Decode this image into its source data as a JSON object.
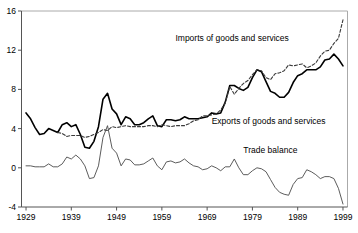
{
  "chart_data": {
    "type": "line",
    "title": "",
    "subtitle": "",
    "xlabel": "",
    "ylabel": "",
    "xlim": [
      1928,
      2000
    ],
    "ylim": [
      -4,
      16
    ],
    "xticks": [
      "1929",
      "1939",
      "1949",
      "1959",
      "1969",
      "1979",
      "1989",
      "1999"
    ],
    "xtick_values": [
      1929,
      1939,
      1949,
      1959,
      1969,
      1979,
      1989,
      1999
    ],
    "yticks": [
      "-4",
      "0",
      "4",
      "8",
      "12",
      "16"
    ],
    "ytick_values": [
      -4,
      0,
      4,
      8,
      12,
      16
    ],
    "grid": false,
    "legend_position": "inline-annotations",
    "x": [
      1929,
      1930,
      1931,
      1932,
      1933,
      1934,
      1935,
      1936,
      1937,
      1938,
      1939,
      1940,
      1941,
      1942,
      1943,
      1944,
      1945,
      1946,
      1947,
      1948,
      1949,
      1950,
      1951,
      1952,
      1953,
      1954,
      1955,
      1956,
      1957,
      1958,
      1959,
      1960,
      1961,
      1962,
      1963,
      1964,
      1965,
      1966,
      1967,
      1968,
      1969,
      1970,
      1971,
      1972,
      1973,
      1974,
      1975,
      1976,
      1977,
      1978,
      1979,
      1980,
      1981,
      1982,
      1983,
      1984,
      1985,
      1986,
      1987,
      1988,
      1989,
      1990,
      1991,
      1992,
      1993,
      1994,
      1995,
      1996,
      1997,
      1998,
      1999
    ],
    "series": [
      {
        "name": "Exports of goods and services",
        "style": "solid-thick",
        "values": [
          5.6,
          5.0,
          4.1,
          3.4,
          3.5,
          4.0,
          3.8,
          3.6,
          4.4,
          4.6,
          4.2,
          4.4,
          3.4,
          2.1,
          2.0,
          2.7,
          4.2,
          7.0,
          7.6,
          6.0,
          5.5,
          4.4,
          5.2,
          5.0,
          4.4,
          4.4,
          4.6,
          5.0,
          5.3,
          4.3,
          4.2,
          4.9,
          4.9,
          4.8,
          4.9,
          5.2,
          5.0,
          5.0,
          5.0,
          5.1,
          5.2,
          5.6,
          5.5,
          5.6,
          6.7,
          8.4,
          8.4,
          8.1,
          7.9,
          8.2,
          9.2,
          10.0,
          9.8,
          8.8,
          7.8,
          7.6,
          7.2,
          7.2,
          7.7,
          8.7,
          9.4,
          9.6,
          10.0,
          10.0,
          10.0,
          10.3,
          11.0,
          11.1,
          11.6,
          11.1,
          10.4
        ]
      },
      {
        "name": "Imports of goods and services",
        "style": "dashed",
        "values": [
          null,
          null,
          null,
          null,
          null,
          null,
          null,
          3.6,
          3.5,
          3.2,
          3.3,
          3.3,
          3.3,
          3.1,
          3.2,
          3.4,
          3.6,
          3.9,
          3.8,
          4.2,
          4.1,
          4.2,
          4.3,
          4.2,
          4.2,
          4.2,
          4.2,
          4.3,
          4.3,
          4.2,
          4.4,
          4.3,
          4.2,
          4.3,
          4.3,
          4.3,
          4.5,
          4.8,
          4.9,
          5.3,
          5.3,
          5.4,
          5.5,
          5.9,
          6.6,
          8.3,
          7.5,
          8.1,
          8.6,
          8.9,
          9.5,
          10.0,
          9.9,
          9.2,
          9.0,
          9.6,
          9.7,
          9.9,
          10.5,
          10.4,
          10.5,
          10.6,
          10.2,
          10.4,
          10.7,
          11.4,
          11.9,
          12.0,
          12.7,
          13.2,
          15.1
        ]
      },
      {
        "name": "Trade balance",
        "style": "solid-thin",
        "values": [
          0.2,
          0.2,
          0.1,
          0.1,
          0.1,
          0.4,
          0.1,
          0.1,
          0.4,
          1.1,
          0.9,
          1.3,
          0.9,
          0.2,
          -1.1,
          -1.0,
          0.2,
          3.1,
          4.3,
          2.0,
          1.5,
          0.2,
          0.9,
          0.8,
          0.3,
          0.3,
          0.4,
          0.7,
          1.0,
          0.2,
          -0.2,
          0.6,
          0.7,
          0.5,
          0.6,
          0.9,
          0.5,
          0.2,
          0.1,
          -0.2,
          -0.1,
          0.2,
          0.0,
          -0.3,
          0.1,
          0.1,
          0.9,
          0.0,
          -0.7,
          -0.7,
          -0.3,
          0.0,
          -0.1,
          -0.4,
          -1.2,
          -2.0,
          -2.5,
          -2.7,
          -2.8,
          -1.7,
          -1.1,
          -1.0,
          -0.2,
          -0.4,
          -0.7,
          -1.1,
          -0.9,
          -0.9,
          -1.1,
          -2.1,
          -3.7
        ]
      }
    ],
    "annotations": [
      {
        "text": "Imports of goods and services",
        "x": 1962,
        "y": 12.9,
        "name": "imports-label"
      },
      {
        "text": "Exports of goods and services",
        "x": 1970,
        "y": 4.5,
        "name": "exports-label"
      },
      {
        "text": "Trade balance",
        "x": 1977,
        "y": 1.5,
        "name": "trade-balance-label"
      }
    ]
  }
}
